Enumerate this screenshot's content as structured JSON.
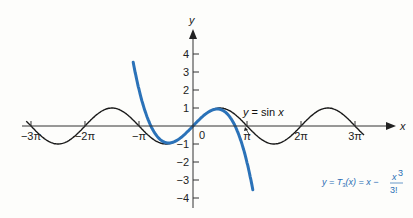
{
  "colors": {
    "sin_curve": "#1a1a1a",
    "taylor_curve": "#2b72b8",
    "axis": "#333333",
    "taylor_label": "#2a6db5",
    "background": "#fdfdfb"
  },
  "axes": {
    "x_label": "x",
    "y_label": "y",
    "x_ticks": [
      "−3π",
      "−2π",
      "−π",
      "π",
      "2π",
      "3π"
    ],
    "y_ticks": [
      "4",
      "3",
      "2",
      "1",
      "−1",
      "−2",
      "−3",
      "−4"
    ],
    "origin_label": "0"
  },
  "annotations": {
    "sin": "y = sin x",
    "taylor_prefix": "y = T",
    "taylor_sub": "3",
    "taylor_mid": "(x) = x −",
    "taylor_num": "x",
    "taylor_num_exp": "3",
    "taylor_den": "3!"
  },
  "chart_data": {
    "type": "line",
    "title": "",
    "xlabel": "x",
    "ylabel": "y",
    "xlim": [
      -9.7,
      10.5
    ],
    "ylim": [
      -4.5,
      4.8
    ],
    "x_tick_values": [
      -9.4248,
      -6.2832,
      -3.1416,
      3.1416,
      6.2832,
      9.4248
    ],
    "x_tick_labels": [
      "−3π",
      "−2π",
      "−π",
      "π",
      "2π",
      "3π"
    ],
    "y_tick_values": [
      -4,
      -3,
      -2,
      -1,
      1,
      2,
      3,
      4
    ],
    "grid": false,
    "legend": "inline annotations",
    "series": [
      {
        "name": "y = sin x",
        "function": "sin(x)",
        "domain": [
          -9.7,
          10.0
        ],
        "color": "#1a1a1a"
      },
      {
        "name": "y = T3(x) = x − x^3/3!",
        "function": "x - x^3/6",
        "domain": [
          -3.4,
          3.4
        ],
        "color": "#2b72b8"
      }
    ]
  }
}
